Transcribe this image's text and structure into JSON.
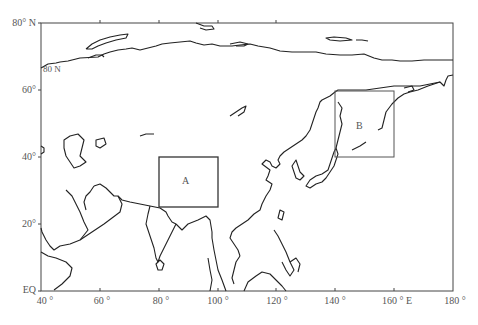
{
  "map": {
    "frame": {
      "lon_min": 40,
      "lon_max": 180,
      "lat_min": 0,
      "lat_max": 80
    },
    "y_axis": {
      "ticks": [
        {
          "lat": 80,
          "label": "80° N"
        },
        {
          "lat": 60,
          "label": "60°"
        },
        {
          "lat": 40,
          "label": "40°"
        },
        {
          "lat": 20,
          "label": "20°"
        },
        {
          "lat": 0,
          "label": "EQ"
        }
      ]
    },
    "x_axis": {
      "ticks": [
        {
          "lon": 40,
          "label": "40 °"
        },
        {
          "lon": 60,
          "label": "60 °"
        },
        {
          "lon": 80,
          "label": "80 °"
        },
        {
          "lon": 100,
          "label": "100 °"
        },
        {
          "lon": 120,
          "label": "120 °"
        },
        {
          "lon": 140,
          "label": "140 °"
        },
        {
          "lon": 160,
          "label": "160 ° E"
        },
        {
          "lon": 180,
          "label": "180 °"
        }
      ]
    },
    "inset_label": "80 N",
    "regions": [
      {
        "id": "A",
        "label": "A",
        "lon": [
          80,
          100
        ],
        "lat": [
          25,
          40
        ]
      },
      {
        "id": "B",
        "label": "B",
        "lon": [
          140,
          160
        ],
        "lat": [
          40,
          60
        ]
      }
    ],
    "colors": {
      "coast": "#222222",
      "frame": "#444444",
      "box": "#333333",
      "text": "#555555"
    }
  }
}
